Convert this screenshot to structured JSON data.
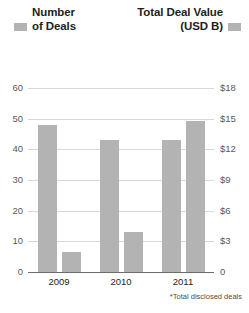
{
  "legend": {
    "left": {
      "line1": "Number",
      "line2": "of Deals",
      "swatch_color": "#b3b3b3",
      "swatch_name": "number-of-deals-swatch"
    },
    "right": {
      "line1": "Total Deal Value",
      "line2": "(USD B)",
      "swatch_color": "#b3b3b3",
      "swatch_name": "total-deal-value-swatch"
    }
  },
  "footnote": "*Total disclosed deals",
  "axes": {
    "left_ticks": [
      "60",
      "50",
      "40",
      "30",
      "20",
      "10",
      "0"
    ],
    "right_ticks": [
      "$18",
      "$15",
      "$12",
      "$9",
      "$6",
      "$3",
      "0"
    ],
    "categories": [
      "2009",
      "2010",
      "2011"
    ]
  },
  "chart_data": {
    "type": "bar",
    "title": "",
    "subtitle": "",
    "xlabel": "",
    "ylabel": "Number of Deals",
    "y2label": "Total Deal Value (USD B)",
    "categories": [
      "2009",
      "2010",
      "2011"
    ],
    "series": [
      {
        "name": "Number of Deals",
        "axis": "left",
        "color": "#b3b3b3",
        "values": [
          48,
          43,
          43
        ]
      },
      {
        "name": "Total Deal Value (USD B)",
        "axis": "right",
        "color": "#b3b3b3",
        "values": [
          2.0,
          3.9,
          14.8
        ]
      }
    ],
    "ylim": [
      0,
      60
    ],
    "y2lim": [
      0,
      18
    ],
    "ytick_values": [
      0,
      10,
      20,
      30,
      40,
      50,
      60
    ],
    "y2tick_values": [
      0,
      3,
      6,
      9,
      12,
      15,
      18
    ],
    "ytick_labels": [
      "0",
      "10",
      "20",
      "30",
      "40",
      "50",
      "60"
    ],
    "y2tick_labels": [
      "0",
      "$3",
      "$6",
      "$9",
      "$12",
      "$15",
      "$18"
    ],
    "grid": true,
    "legend_position": "top",
    "annotations": [
      "*Total disclosed deals"
    ]
  }
}
